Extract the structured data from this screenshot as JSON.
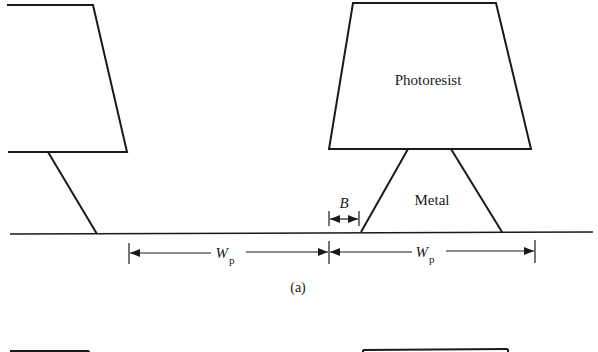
{
  "figure": {
    "caption": "(a)",
    "labels": {
      "photoresist": "Photoresist",
      "metal": "Metal",
      "bias": "B",
      "pitch_main": "W",
      "pitch_sub": "p"
    },
    "colors": {
      "stroke": "#1a1a1a",
      "background": "#ffffff"
    },
    "dimensions": [
      {
        "name": "bias",
        "label": "B",
        "from_x": 329,
        "to_x": 359
      },
      {
        "name": "pitch-left",
        "label": "Wp",
        "from_x": 129,
        "to_x": 329
      },
      {
        "name": "pitch-right",
        "label": "Wp",
        "from_x": 329,
        "to_x": 535
      }
    ]
  }
}
